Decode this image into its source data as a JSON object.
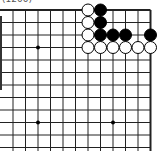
{
  "caption": "(1200)",
  "board": {
    "grid_x": [
      13,
      25.5,
      38,
      50.5,
      63,
      75.5,
      88,
      100.5,
      113,
      125.5,
      138,
      150.5
    ],
    "grid_y": [
      10,
      22.5,
      35,
      47.5,
      60,
      72.5,
      85,
      97.5,
      110,
      122.5,
      135,
      147.5
    ],
    "right_edge_col": 11,
    "top_edge_row": 0,
    "line_color": "#222222",
    "star_points": [
      [
        2,
        3
      ],
      [
        2,
        9
      ],
      [
        8,
        9
      ]
    ],
    "stones": [
      {
        "color": "white",
        "col": 6,
        "row": 0
      },
      {
        "color": "black",
        "col": 7,
        "row": 0
      },
      {
        "color": "white",
        "col": 6,
        "row": 1
      },
      {
        "color": "black",
        "col": 7,
        "row": 1
      },
      {
        "color": "white",
        "col": 6,
        "row": 2
      },
      {
        "color": "black",
        "col": 7,
        "row": 2
      },
      {
        "color": "black",
        "col": 8,
        "row": 2
      },
      {
        "color": "black",
        "col": 9,
        "row": 2
      },
      {
        "color": "black",
        "col": 11,
        "row": 2
      },
      {
        "color": "white",
        "col": 6,
        "row": 3
      },
      {
        "color": "white",
        "col": 7,
        "row": 3
      },
      {
        "color": "white",
        "col": 8,
        "row": 3
      },
      {
        "color": "white",
        "col": 9,
        "row": 3
      },
      {
        "color": "white",
        "col": 10,
        "row": 3
      },
      {
        "color": "white",
        "col": 11,
        "row": 3
      }
    ]
  }
}
